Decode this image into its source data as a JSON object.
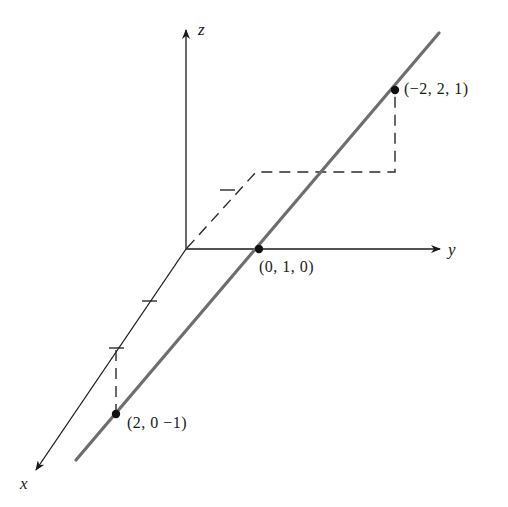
{
  "diagram": {
    "type": "3d-coordinate-line",
    "axes": {
      "x_label": "x",
      "y_label": "y",
      "z_label": "z"
    },
    "points": [
      {
        "label": "(0, 1, 0)",
        "coords": [
          0,
          1,
          0
        ]
      },
      {
        "label": "(−2, 2, 1)",
        "coords": [
          -2,
          2,
          1
        ]
      },
      {
        "label": "(2, 0 −1)",
        "coords": [
          2,
          0,
          -1
        ]
      }
    ],
    "colors": {
      "axis": "#1a1a1a",
      "line": "#6e6e6e",
      "dashed": "#2a2a2a",
      "point": "#111111"
    }
  }
}
